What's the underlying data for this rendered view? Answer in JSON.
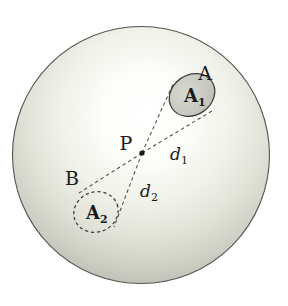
{
  "figure": {
    "title": "",
    "sphere": {
      "name": "outer-sphere",
      "cx": 141,
      "cy": 155,
      "r": 129,
      "outline_color": "#4a4a46",
      "fill_light": "#ffffff",
      "fill_mid": "#e8e9e2",
      "fill_dark": "#a9aba1"
    },
    "point_p": {
      "label": "P",
      "x": 142,
      "y": 153,
      "label_x": 125,
      "label_y": 147,
      "dot_color": "#1a1a1a"
    },
    "regions": [
      {
        "name": "region-a",
        "outer_label": "A",
        "outer_label_x": 205,
        "outer_label_y": 73,
        "inner_label": "A",
        "inner_subscript": "1",
        "cx": 192,
        "cy": 95,
        "rx": 24,
        "ry": 20,
        "rotation": -35,
        "stroke_style": "solid",
        "stroke_color": "#3c3c38",
        "fill_color": "#c9cbc2"
      },
      {
        "name": "region-b",
        "outer_label": "B",
        "outer_label_x": 72,
        "outer_label_y": 180,
        "inner_label": "A",
        "inner_subscript": "2",
        "cx": 96,
        "cy": 212,
        "rx": 22,
        "ry": 20,
        "rotation": -20,
        "stroke_style": "dashed",
        "stroke_color": "#3c3c38",
        "fill_color": "none"
      }
    ],
    "distances": [
      {
        "name": "distance-d1",
        "symbol": "d",
        "subscript": "1",
        "label_x": 170,
        "label_y": 160,
        "from": "P",
        "to": "A1"
      },
      {
        "name": "distance-d2",
        "symbol": "d",
        "subscript": "2",
        "label_x": 140,
        "label_y": 197,
        "from": "P",
        "to": "A2"
      }
    ],
    "tangent_lines": [
      {
        "name": "tangent-p-to-a1-upper",
        "x1": 142,
        "y1": 153,
        "x2": 174,
        "y2": 82
      },
      {
        "name": "tangent-p-to-a1-lower",
        "x1": 142,
        "y1": 153,
        "x2": 212,
        "y2": 111
      },
      {
        "name": "tangent-p-to-a2-upper",
        "x1": 142,
        "y1": 153,
        "x2": 80,
        "y2": 194
      },
      {
        "name": "tangent-p-to-a2-lower",
        "x1": 142,
        "y1": 153,
        "x2": 114,
        "y2": 226
      }
    ],
    "line_style": {
      "color": "#4a4a46",
      "dash": "3.5 3",
      "width": 1.1
    }
  }
}
